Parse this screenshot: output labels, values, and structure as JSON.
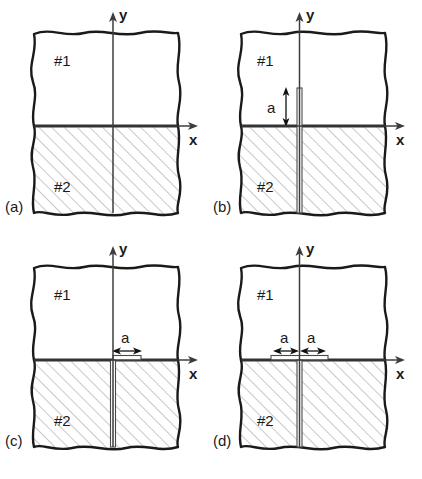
{
  "figure": {
    "panels": [
      {
        "id": "a",
        "label": "(a)",
        "material_top": "#1",
        "material_bottom": "#2",
        "axis_x": "x",
        "axis_y": "y",
        "crack": "none",
        "dimensions": []
      },
      {
        "id": "b",
        "label": "(b)",
        "material_top": "#1",
        "material_bottom": "#2",
        "axis_x": "x",
        "axis_y": "y",
        "crack": "vertical-crossing-interface",
        "dimensions": [
          {
            "label": "a",
            "orientation": "vertical"
          }
        ]
      },
      {
        "id": "c",
        "label": "(c)",
        "material_top": "#1",
        "material_bottom": "#2",
        "axis_x": "x",
        "axis_y": "y",
        "crack": "interface-right-plus-vertical",
        "dimensions": [
          {
            "label": "a",
            "orientation": "horizontal"
          }
        ]
      },
      {
        "id": "d",
        "label": "(d)",
        "material_top": "#1",
        "material_bottom": "#2",
        "axis_x": "x",
        "axis_y": "y",
        "crack": "interface-symmetric-plus-vertical",
        "dimensions": [
          {
            "label": "a",
            "orientation": "horizontal"
          },
          {
            "label": "a",
            "orientation": "horizontal"
          }
        ]
      }
    ],
    "colors": {
      "outline": "#1a1a1a",
      "hatch": "#9a9a9a",
      "axis": "#3c3c3c",
      "background": "#ffffff"
    },
    "caption": ""
  }
}
